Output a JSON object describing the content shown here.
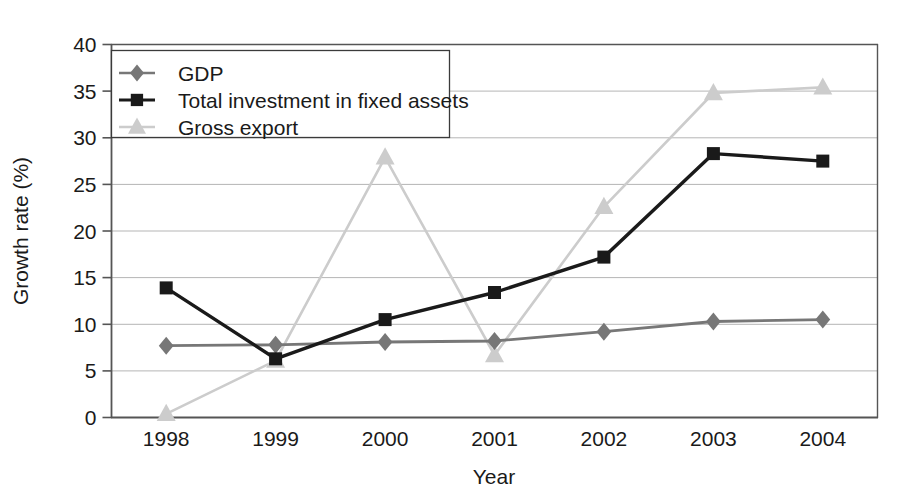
{
  "chart_data": {
    "type": "line",
    "title": "",
    "subtitle": "",
    "xlabel": "Year",
    "ylabel": "Growth rate (%)",
    "categories": [
      "1998",
      "1999",
      "2000",
      "2001",
      "2002",
      "2003",
      "2004"
    ],
    "xlim": [
      1998,
      2004
    ],
    "ylim": [
      0,
      40
    ],
    "yticks": [
      "0",
      "5",
      "10",
      "15",
      "20",
      "25",
      "30",
      "35",
      "40"
    ],
    "ytick_values": [
      0,
      5,
      10,
      15,
      20,
      25,
      30,
      35,
      40
    ],
    "grid": true,
    "grid_axis": "y",
    "legend_position": "top-left",
    "series": [
      {
        "name": "GDP",
        "marker": "diamond",
        "color": "#777777",
        "values": [
          7.7,
          7.8,
          8.1,
          8.2,
          9.2,
          10.3,
          10.5
        ]
      },
      {
        "name": "Total investment in fixed assets",
        "marker": "square",
        "color": "#1a1a1a",
        "values": [
          13.9,
          6.3,
          10.5,
          13.4,
          17.2,
          28.3,
          27.5
        ]
      },
      {
        "name": "Gross export",
        "marker": "triangle",
        "color": "#cccccc",
        "values": [
          0.4,
          6.1,
          27.9,
          6.7,
          22.6,
          34.8,
          35.4
        ]
      }
    ]
  },
  "axes": {
    "y_axis_title": "Growth rate (%)",
    "x_axis_title": "Year"
  },
  "legend": {
    "entries": [
      {
        "label": "GDP"
      },
      {
        "label": "Total investment in fixed assets"
      },
      {
        "label": "Gross export"
      }
    ]
  },
  "colors": {
    "gdp": "#777777",
    "investment": "#1a1a1a",
    "export": "#cccccc",
    "grid": "#b5b5b5",
    "frame": "#555555",
    "text": "#1a1a1a",
    "background": "#ffffff"
  }
}
